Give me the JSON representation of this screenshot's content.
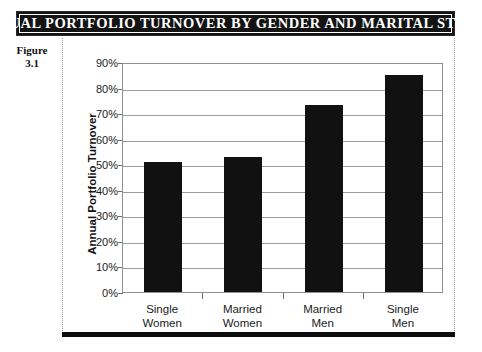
{
  "figure": {
    "title": "ANNUAL PORTFOLIO TURNOVER BY GENDER AND MARITAL STATUS",
    "label_line1": "Figure",
    "label_line2": "3.1"
  },
  "colors": {
    "banner_background": "#131313",
    "banner_text": "#ffffff",
    "bar": "#111111",
    "gridline": "#9d9d9d",
    "axis": "#8f8f8f",
    "page_background": "#ffffff"
  },
  "chart_data": {
    "type": "bar",
    "title": "ANNUAL PORTFOLIO TURNOVER BY GENDER AND MARITAL STATUS",
    "categories": [
      "Single Women",
      "Married Women",
      "Married Men",
      "Single Men"
    ],
    "category_lines": [
      [
        "Single",
        "Women"
      ],
      [
        "Married",
        "Women"
      ],
      [
        "Married",
        "Men"
      ],
      [
        "Single",
        "Men"
      ]
    ],
    "values": [
      51,
      53,
      73,
      85
    ],
    "value_labels": [
      "51%",
      "53%",
      "73%",
      "85%"
    ],
    "xlabel": "",
    "ylabel": "Annual Portfolio Turnover",
    "ylim": [
      0,
      90
    ],
    "ytick_values": [
      90,
      80,
      70,
      60,
      50,
      40,
      30,
      20,
      10,
      0
    ],
    "ytick_labels": [
      "90%",
      "80%",
      "70%",
      "60%",
      "50%",
      "40%",
      "30%",
      "20%",
      "10%",
      "0%"
    ],
    "grid": true,
    "grid_axis": "y",
    "legend": false,
    "legend_position": "none"
  }
}
